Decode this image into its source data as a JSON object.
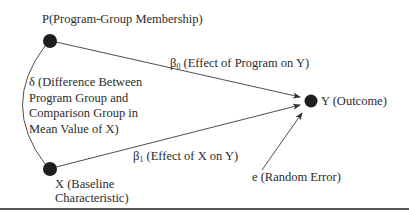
{
  "diagram": {
    "nodes": {
      "p": {
        "label": "P(Program-Group Membership)",
        "x": 50,
        "y": 41
      },
      "x": {
        "label_line1": "X (Baseline",
        "label_line2": "Characteristic)",
        "x": 50,
        "y": 169
      },
      "y": {
        "label": "Y (Outcome)",
        "x": 311,
        "y": 101
      },
      "e": {
        "label": "e (Random Error)"
      }
    },
    "edges": {
      "beta0": {
        "symbol": "β",
        "subscript": "0",
        "text": " (Effect of Program on Y)"
      },
      "beta1": {
        "symbol": "β",
        "subscript": "1",
        "text": " (Effect of X on Y)"
      },
      "delta": {
        "line1": "δ (Difference Between",
        "line2": "Program Group and",
        "line3": "Comparison Group in",
        "line4": "Mean Value of X)"
      }
    },
    "colors": {
      "node_fill": "#1e1e1e",
      "line": "#3a3a3a",
      "text": "#2b2b2b",
      "rule": "#555555"
    }
  }
}
